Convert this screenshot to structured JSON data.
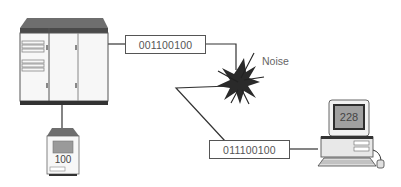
{
  "diagram": {
    "nodes": {
      "mainframe": {
        "type": "mainframe-computer"
      },
      "terminal": {
        "type": "terminal",
        "display_value": "100"
      },
      "pc": {
        "type": "personal-computer",
        "display_value": "228"
      },
      "noise": {
        "type": "noise-burst",
        "label": "Noise"
      }
    },
    "signals": {
      "sent": {
        "bits": "001100100"
      },
      "received": {
        "bits": "011100100"
      }
    },
    "colors": {
      "line": "#333333",
      "cabinet_top": "#707070",
      "box_border": "#555555",
      "noise_fill": "#2a2a2a",
      "screen": "#9a9a9a"
    }
  }
}
